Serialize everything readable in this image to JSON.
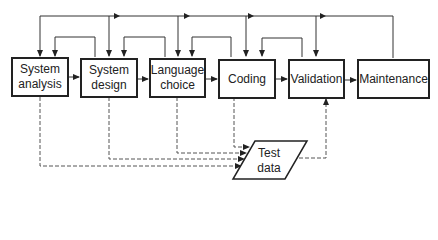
{
  "diagram": {
    "type": "flowchart",
    "stages": [
      {
        "label": "System\nanalysis",
        "line1": "System",
        "line2": "analysis"
      },
      {
        "label": "System\ndesign",
        "line1": "System",
        "line2": "design"
      },
      {
        "label": "Language\nchoice",
        "line1": "Language",
        "line2": "choice"
      },
      {
        "label": "Coding",
        "line1": "Coding",
        "line2": ""
      },
      {
        "label": "Validation",
        "line1": "Validation",
        "line2": ""
      },
      {
        "label": "Maintenance",
        "line1": "Maintenance",
        "line2": ""
      }
    ],
    "data_store": {
      "line1": "Test",
      "line2": "data"
    },
    "edges": [
      {
        "from": "System analysis",
        "to": "System design",
        "style": "solid"
      },
      {
        "from": "System design",
        "to": "Language choice",
        "style": "solid"
      },
      {
        "from": "Language choice",
        "to": "Coding",
        "style": "solid"
      },
      {
        "from": "Coding",
        "to": "Validation",
        "style": "solid"
      },
      {
        "from": "Validation",
        "to": "Maintenance",
        "style": "solid"
      },
      {
        "from": "System design",
        "to": "System analysis",
        "style": "feedback"
      },
      {
        "from": "Language choice",
        "to": "System design",
        "style": "feedback"
      },
      {
        "from": "Coding",
        "to": "Language choice",
        "style": "feedback"
      },
      {
        "from": "Validation",
        "to": "Coding",
        "style": "feedback"
      },
      {
        "from": "Maintenance",
        "to": "Validation",
        "style": "feedback"
      },
      {
        "from": "Maintenance",
        "to": "Coding",
        "style": "feedback"
      },
      {
        "from": "Maintenance",
        "to": "Language choice",
        "style": "feedback"
      },
      {
        "from": "Maintenance",
        "to": "System design",
        "style": "feedback"
      },
      {
        "from": "Maintenance",
        "to": "System analysis",
        "style": "feedback"
      },
      {
        "from": "System analysis",
        "to": "Test data",
        "style": "dashed"
      },
      {
        "from": "System design",
        "to": "Test data",
        "style": "dashed"
      },
      {
        "from": "Language choice",
        "to": "Test data",
        "style": "dashed"
      },
      {
        "from": "Coding",
        "to": "Test data",
        "style": "dashed"
      },
      {
        "from": "Test data",
        "to": "Validation",
        "style": "dashed"
      }
    ]
  }
}
